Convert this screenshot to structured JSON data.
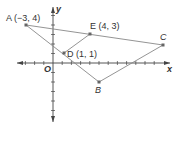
{
  "diagram": {
    "type": "coordinate-plane-triangle",
    "origin_label": "O",
    "x_axis_label": "x",
    "y_axis_label": "y",
    "points": [
      {
        "id": "A",
        "label": "A (−3, 4)",
        "x": -3,
        "y": 4
      },
      {
        "id": "E",
        "label": "E (4, 3)",
        "x": 4,
        "y": 3
      },
      {
        "id": "C",
        "label": "C",
        "x": 12,
        "y": 2
      },
      {
        "id": "D",
        "label": "D (1, 1)",
        "x": 1,
        "y": 1
      },
      {
        "id": "B",
        "label": "B",
        "x": 5,
        "y": -2
      }
    ],
    "segments": [
      [
        "A",
        "C"
      ],
      [
        "A",
        "B"
      ],
      [
        "B",
        "C"
      ],
      [
        "D",
        "E"
      ]
    ],
    "colors": {
      "line": "#888888",
      "axis": "#444444",
      "point": "#666666",
      "text": "#333333"
    }
  }
}
